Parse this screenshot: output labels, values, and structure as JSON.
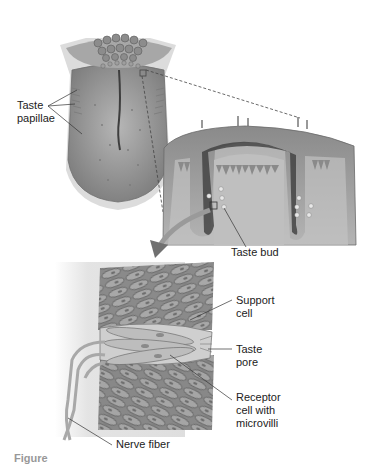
{
  "figure": {
    "panels": [
      {
        "id": "tongue",
        "title": "Tongue surface"
      },
      {
        "id": "papilla-section",
        "title": "Cross-section of papilla"
      },
      {
        "id": "taste-bud-detail",
        "title": "Taste bud enlarged"
      }
    ],
    "labels": {
      "taste_papillae": "Taste\npapillae",
      "taste_bud": "Taste bud",
      "support_cell": "Support\ncell",
      "taste_pore": "Taste\npore",
      "receptor_cell": "Receptor\ncell with\nmicrovilli",
      "nerve_fiber": "Nerve fiber"
    },
    "caption_partial": "Figure"
  },
  "colors": {
    "tissue_light": "#b9b9b9",
    "tissue_mid": "#8f8f8f",
    "tissue_dark": "#5e5e5e",
    "line": "#444444",
    "background": "#ffffff"
  }
}
